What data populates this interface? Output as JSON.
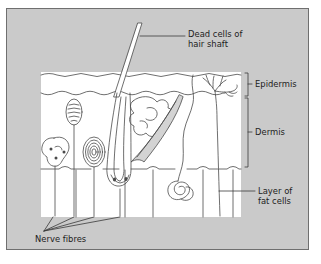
{
  "figure": {
    "background_color": "#cacaca",
    "panel_color": "#ffffff",
    "border_color": "#6f6f6f",
    "ink_color": "#4a4a4a",
    "text_color": "#1c1c1c"
  },
  "labels": {
    "hair_shaft": "Dead cells of\nhair shaft",
    "epidermis": "Epidermis",
    "dermis": "Dermis",
    "fat_layer": "Layer of\nfat cells",
    "nerve_fibres": "Nerve fibres"
  },
  "structures": [
    {
      "name": "hair-shaft",
      "label": "Dead cells of hair shaft"
    },
    {
      "name": "hair-follicle",
      "label": "Hair follicle"
    },
    {
      "name": "sebaceous-gland",
      "label": "Sebaceous gland"
    },
    {
      "name": "erector-muscle",
      "label": "Erector muscle"
    },
    {
      "name": "krause-receptor",
      "label": "Coiled nerve receptor"
    },
    {
      "name": "ruffini-receptor",
      "label": "Lobed nerve receptor"
    },
    {
      "name": "pacinian-receptor",
      "label": "Concentric nerve receptor"
    },
    {
      "name": "sweat-gland",
      "label": "Coiled sweat gland"
    },
    {
      "name": "free-nerve-endings",
      "label": "Free nerve endings"
    },
    {
      "name": "fat-cells",
      "label": "Fat cells"
    }
  ],
  "layers": [
    {
      "name": "epidermis",
      "label": "Epidermis"
    },
    {
      "name": "dermis",
      "label": "Dermis"
    },
    {
      "name": "fat-layer",
      "label": "Layer of fat cells"
    }
  ]
}
